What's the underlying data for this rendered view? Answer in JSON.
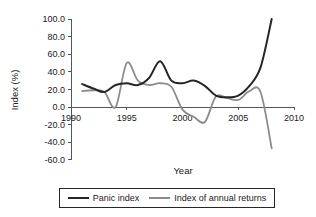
{
  "chart_data": {
    "type": "line",
    "title": "",
    "xlabel": "Year",
    "ylabel": "Index (%)",
    "xlim": [
      1990,
      2010
    ],
    "ylim": [
      -60.0,
      100.0
    ],
    "grid": false,
    "legend_position": "bottom",
    "xticks": [
      "1990",
      "1995",
      "2000",
      "2005",
      "2010"
    ],
    "xtick_values": [
      1990,
      1995,
      2000,
      2005,
      2010
    ],
    "yticks": [
      "100.0",
      "80.0",
      "60.0",
      "40.0",
      "20.0",
      "0.0",
      "-20.0",
      "-40.0",
      "-60.0"
    ],
    "ytick_values": [
      100.0,
      80.0,
      60.0,
      40.0,
      20.0,
      0.0,
      -20.0,
      -40.0,
      -60.0
    ],
    "x": [
      1991,
      1992,
      1993,
      1994,
      1995,
      1996,
      1997,
      1998,
      1999,
      2000,
      2001,
      2002,
      2003,
      2004,
      2005,
      2006,
      2007,
      2008
    ],
    "series": [
      {
        "name": "Panic index",
        "color": "#262626",
        "values": [
          26.0,
          21.0,
          17.0,
          25.0,
          27.0,
          25.0,
          33.0,
          52.0,
          30.0,
          27.0,
          30.0,
          24.0,
          13.0,
          11.0,
          13.0,
          24.0,
          45.0,
          100.0
        ]
      },
      {
        "name": "Index of annual returns",
        "color": "#8c8c8c",
        "values": [
          18.0,
          19.0,
          17.0,
          0.0,
          50.0,
          30.0,
          25.0,
          27.0,
          23.0,
          -3.0,
          -11.0,
          -17.0,
          12.0,
          10.0,
          8.0,
          18.0,
          17.0,
          -47.0
        ]
      }
    ]
  },
  "legend": {
    "items": [
      {
        "label": "Panic index",
        "color": "#262626"
      },
      {
        "label": "Index of annual returns",
        "color": "#8c8c8c"
      }
    ]
  },
  "axes": {
    "y_axis_title": "Index (%)",
    "x_axis_title": "Year"
  }
}
